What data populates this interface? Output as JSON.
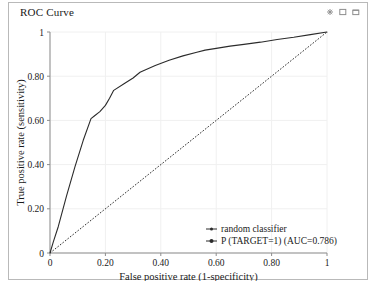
{
  "window": {
    "title": "ROC Curve",
    "controls": [
      {
        "name": "minimize-icon",
        "glyph": "minimize"
      },
      {
        "name": "restore-icon",
        "glyph": "restore"
      },
      {
        "name": "maximize-icon",
        "glyph": "maximize"
      }
    ]
  },
  "chart_data": {
    "type": "line",
    "title": "ROC Curve",
    "xlabel": "False positive rate (1-specificity)",
    "ylabel": "True positive rate (sensitivity)",
    "xlim": [
      0,
      1
    ],
    "ylim": [
      0,
      1
    ],
    "grid": true,
    "legend_position": "lower right",
    "xticks": [
      0,
      0.2,
      0.4,
      0.6,
      0.8,
      1
    ],
    "yticks": [
      0,
      0.2,
      0.4,
      0.6,
      0.8,
      1
    ],
    "xticklabels": [
      "0",
      "0.20",
      "0.40",
      "0.60",
      "0.80",
      "1"
    ],
    "yticklabels": [
      "0",
      "0.20",
      "0.40",
      "0.60",
      "0.80",
      "1"
    ],
    "series": [
      {
        "name": "random classifier",
        "style": "dashed",
        "x": [
          0,
          1
        ],
        "y": [
          0,
          1
        ]
      },
      {
        "name": "P (TARGET=1) (AUC=0.786)",
        "style": "solid",
        "auc": 0.786,
        "x": [
          0.0,
          0.012,
          0.03,
          0.06,
          0.09,
          0.12,
          0.148,
          0.16,
          0.18,
          0.2,
          0.215,
          0.23,
          0.27,
          0.3,
          0.325,
          0.335,
          0.38,
          0.43,
          0.48,
          0.53,
          0.56,
          0.6,
          0.65,
          0.7,
          0.76,
          0.82,
          0.88,
          0.94,
          1.0
        ],
        "y": [
          0.0,
          0.05,
          0.12,
          0.26,
          0.39,
          0.51,
          0.608,
          0.62,
          0.64,
          0.668,
          0.7,
          0.736,
          0.768,
          0.792,
          0.818,
          0.824,
          0.848,
          0.872,
          0.892,
          0.908,
          0.918,
          0.926,
          0.936,
          0.944,
          0.954,
          0.966,
          0.976,
          0.988,
          1.0
        ]
      }
    ]
  }
}
